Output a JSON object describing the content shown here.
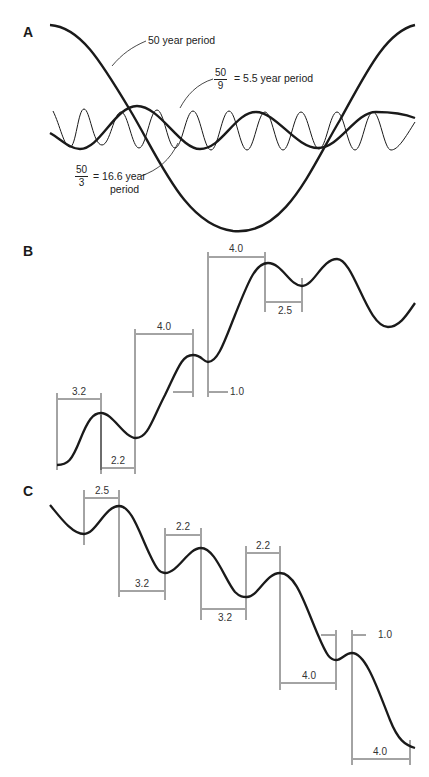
{
  "figure": {
    "panels": [
      {
        "id": "A",
        "label": "A",
        "description": "Superposition of three cycles",
        "annotations": {
          "fifty_year": {
            "text": "50 year period"
          },
          "five_five_year": {
            "numerator": "50",
            "denominator": "9",
            "text": "= 5.5 year period"
          },
          "sixteen_six_year": {
            "numerator": "50",
            "denominator": "3",
            "text_line1": "= 16.6 year",
            "text_line2": "period"
          }
        },
        "curves": [
          {
            "name": "50 year period",
            "period_years": 50,
            "stroke": "thick"
          },
          {
            "name": "16.6 year period",
            "period_years": 16.6,
            "stroke": "thick"
          },
          {
            "name": "5.5 year period",
            "period_years": 5.5,
            "stroke": "thin"
          }
        ]
      },
      {
        "id": "B",
        "label": "B",
        "description": "Rising trend with cycle intervals",
        "dimensions": [
          {
            "value": "3.2"
          },
          {
            "value": "2.2"
          },
          {
            "value": "4.0"
          },
          {
            "value": "1.0"
          },
          {
            "value": "4.0"
          },
          {
            "value": "2.5"
          }
        ]
      },
      {
        "id": "C",
        "label": "C",
        "description": "Falling trend with cycle intervals",
        "dimensions": [
          {
            "value": "2.5"
          },
          {
            "value": "3.2"
          },
          {
            "value": "2.2"
          },
          {
            "value": "3.2"
          },
          {
            "value": "2.2"
          },
          {
            "value": "4.0"
          },
          {
            "value": "1.0"
          },
          {
            "value": "4.0"
          }
        ]
      }
    ],
    "colors": {
      "ink": "#1a1a1a",
      "background": "#ffffff"
    }
  }
}
